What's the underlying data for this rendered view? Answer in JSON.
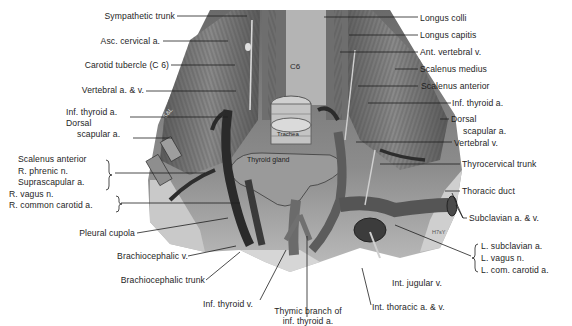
{
  "figure": {
    "inline_labels": {
      "vertebra": "C6",
      "trachea": "Trachea",
      "thyroid_gland": "Thyroid gland",
      "muscle_tag": "S&L",
      "signature": "H7sY"
    },
    "labels_left": [
      {
        "id": "sympathetic-trunk",
        "text": "Sympathetic trunk"
      },
      {
        "id": "asc-cervical-a",
        "text": "Asc. cervical a."
      },
      {
        "id": "carotid-tubercle",
        "text": "Carotid tubercle (C 6)"
      },
      {
        "id": "vertebral-a-v",
        "text": "Vertebral a. & v."
      },
      {
        "id": "inf-thyroid-a-left",
        "text": "Inf. thyroid a."
      },
      {
        "id": "dorsal-scapular-a-left-1",
        "text": "Dorsal"
      },
      {
        "id": "dorsal-scapular-a-left-2",
        "text": "scapular a."
      },
      {
        "id": "scalenus-anterior-left",
        "text": "Scalenus anterior"
      },
      {
        "id": "r-phrenic-n",
        "text": "R. phrenic n."
      },
      {
        "id": "suprascapular-a",
        "text": "Suprascapular a."
      },
      {
        "id": "r-vagus-n",
        "text": "R. vagus n."
      },
      {
        "id": "r-common-carotid-a",
        "text": "R. common carotid a."
      },
      {
        "id": "pleural-cupola",
        "text": "Pleural cupola"
      },
      {
        "id": "brachiocephalic-v",
        "text": "Brachiocephalic v."
      },
      {
        "id": "brachiocephalic-trunk",
        "text": "Brachiocephalic trunk"
      }
    ],
    "labels_right": [
      {
        "id": "longus-colli",
        "text": "Longus colli"
      },
      {
        "id": "longus-capitis",
        "text": "Longus capitis"
      },
      {
        "id": "ant-vertebral-v",
        "text": "Ant. vertebral v."
      },
      {
        "id": "scalenus-medius",
        "text": "Scalenus medius"
      },
      {
        "id": "scalenus-anterior-right",
        "text": "Scalenus anterior"
      },
      {
        "id": "inf-thyroid-a-right",
        "text": "Inf. thyroid a."
      },
      {
        "id": "dorsal-scapular-a-right-1",
        "text": "Dorsal"
      },
      {
        "id": "dorsal-scapular-a-right-2",
        "text": "scapular a."
      },
      {
        "id": "vertebral-v",
        "text": "Vertebral v."
      },
      {
        "id": "thyrocervical-trunk",
        "text": "Thyrocervical trunk"
      },
      {
        "id": "thoracic-duct",
        "text": "Thoracic duct"
      },
      {
        "id": "subclavian-a-v",
        "text": "Subclavian a. & v."
      },
      {
        "id": "l-subclavian-a",
        "text": "L. subclavian a."
      },
      {
        "id": "l-vagus-n",
        "text": "L. vagus n."
      },
      {
        "id": "l-com-carotid-a",
        "text": "L. com. carotid a."
      }
    ],
    "labels_bottom": [
      {
        "id": "inf-thyroid-v",
        "text": "Inf. thyroid v."
      },
      {
        "id": "thymic-branch-1",
        "text": "Thymic branch of"
      },
      {
        "id": "thymic-branch-2",
        "text": "inf. thyroid a."
      },
      {
        "id": "int-thoracic-a-v",
        "text": "Int. thoracic a. & v."
      },
      {
        "id": "int-jugular-v",
        "text": "Int. jugular v."
      }
    ]
  }
}
